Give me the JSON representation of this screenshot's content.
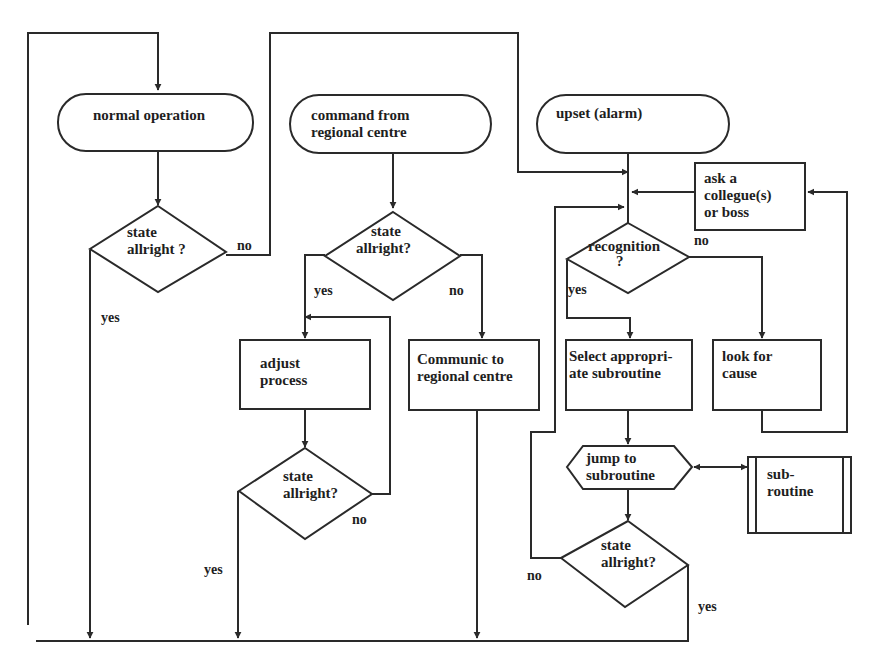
{
  "diagram": {
    "type": "flowchart",
    "colors": {
      "stroke": "#2a2a2a",
      "text": "#1e1e1e",
      "background": "#ffffff"
    },
    "nodes": {
      "normal_operation": {
        "kind": "terminal",
        "lines": [
          "normal operation"
        ]
      },
      "state_check_1": {
        "kind": "decision",
        "lines": [
          "state",
          "allright ?"
        ]
      },
      "command_regional": {
        "kind": "terminal",
        "lines": [
          "command from",
          "regional centre"
        ]
      },
      "state_check_2": {
        "kind": "decision",
        "lines": [
          "state",
          "allright?"
        ]
      },
      "adjust_process": {
        "kind": "process",
        "lines": [
          "adjust",
          "process"
        ]
      },
      "state_check_3": {
        "kind": "decision",
        "lines": [
          "state",
          "allright?"
        ]
      },
      "communic_regional": {
        "kind": "process",
        "lines": [
          "Communic to",
          "regional centre"
        ]
      },
      "upset_alarm": {
        "kind": "terminal",
        "lines": [
          "upset (alarm)"
        ]
      },
      "ask_colleague": {
        "kind": "process",
        "lines": [
          "ask a",
          "collegue(s)",
          "or boss"
        ]
      },
      "recognition": {
        "kind": "decision",
        "lines": [
          "recognition",
          "?"
        ]
      },
      "select_subroutine": {
        "kind": "process",
        "lines": [
          "Select appropri-",
          "ate subroutine"
        ]
      },
      "look_for_cause": {
        "kind": "process",
        "lines": [
          "look for",
          "cause"
        ]
      },
      "jump_subroutine": {
        "kind": "preparation",
        "lines": [
          "jump to",
          "subroutine"
        ]
      },
      "subroutine": {
        "kind": "predefined-process",
        "lines": [
          "sub-",
          "routine"
        ]
      },
      "state_check_4": {
        "kind": "decision",
        "lines": [
          "state",
          "allright?"
        ]
      }
    },
    "edge_labels": {
      "check1_no": "no",
      "check1_yes": "yes",
      "check2_yes": "yes",
      "check2_no": "no",
      "check3_no": "no",
      "check3_yes": "yes",
      "recognition_no": "no",
      "recognition_yes": "yes",
      "check4_no": "no",
      "check4_yes": "yes"
    }
  }
}
